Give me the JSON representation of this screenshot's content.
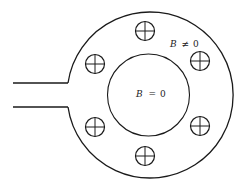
{
  "diagram": {
    "colors": {
      "stroke": "#1a1a1a",
      "background": "#ffffff",
      "text": "#222222"
    },
    "outer_region_label": {
      "variable": "B",
      "relation": "≠",
      "value": "0"
    },
    "inner_region_label": {
      "variable": "B",
      "relation": "=",
      "value": "0"
    },
    "outer_circle": {
      "cx": 150,
      "cy": 94,
      "r": 83
    },
    "inner_circle": {
      "cx": 148.5,
      "cy": 95,
      "r": 41
    },
    "feed_lines": [
      {
        "x1": 13,
        "y1": 83,
        "x2": 68,
        "y2": 83
      },
      {
        "x1": 13,
        "y1": 107,
        "x2": 68,
        "y2": 107
      }
    ],
    "current_elements": [
      {
        "name": "top",
        "cx": 145,
        "cy": 31,
        "symbol": "crossed-circle"
      },
      {
        "name": "upper-right",
        "cx": 200,
        "cy": 61,
        "symbol": "crossed-circle"
      },
      {
        "name": "lower-right",
        "cx": 200,
        "cy": 126,
        "symbol": "crossed-circle"
      },
      {
        "name": "bottom",
        "cx": 145,
        "cy": 156,
        "symbol": "crossed-circle"
      },
      {
        "name": "lower-left",
        "cx": 95,
        "cy": 127,
        "symbol": "crossed-circle"
      },
      {
        "name": "upper-left",
        "cx": 95,
        "cy": 64,
        "symbol": "crossed-circle"
      }
    ],
    "current_element_radius": 9.5
  }
}
